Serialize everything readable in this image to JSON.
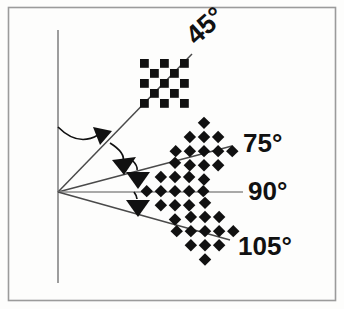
{
  "figure": {
    "background_color": "#fdfdfc",
    "border_color": "#9b9b9b",
    "ink_color": "#111111",
    "ray_color": "#4a4a4a",
    "axis_line_color": "#8c8c8c"
  },
  "vertical_axis": {
    "name": "vertical-reference-line",
    "x": 58,
    "y_top": 30,
    "y_bottom": 283,
    "color": "#8c8c8c"
  },
  "vertex": {
    "x": 58,
    "y": 192
  },
  "rays": [
    {
      "id": "ray-45",
      "angle_label": "45",
      "degree_symbol": "°",
      "label_text": "45°",
      "label_rotation_deg": -42,
      "label_x": 196,
      "label_y": 46,
      "tip_x": 192,
      "tip_y": 54
    },
    {
      "id": "ray-75",
      "angle_label": "75",
      "degree_symbol": "°",
      "label_text": "75°",
      "label_rotation_deg": 0,
      "label_x": 243,
      "label_y": 152,
      "tip_x": 232,
      "tip_y": 146
    },
    {
      "id": "ray-90",
      "angle_label": "90",
      "degree_symbol": "°",
      "label_text": "90°",
      "label_rotation_deg": 0,
      "label_x": 248,
      "label_y": 200,
      "tip_x": 243,
      "tip_y": 192
    },
    {
      "id": "ray-105",
      "angle_label": "105",
      "degree_symbol": "°",
      "label_text": "105°",
      "label_rotation_deg": 0,
      "label_x": 238,
      "label_y": 255,
      "tip_x": 230,
      "tip_y": 240
    }
  ],
  "arc_arrows": [
    {
      "id": "arc-vertical-to-45",
      "label": "rotation-from-vertical-to-45"
    },
    {
      "id": "arc-45-to-75",
      "label": "rotation-from-45-to-75"
    },
    {
      "id": "arc-75-to-90",
      "label": "rotation-from-75-to-90"
    },
    {
      "id": "arc-90-to-105",
      "label": "rotation-from-90-to-105"
    }
  ],
  "patterns": [
    {
      "id": "checkerboard-45",
      "for_angle": "45°",
      "center_x": 165,
      "center_y": 84,
      "cell": 10,
      "cols": 5,
      "rows": 5,
      "rotation_deg": 0,
      "squash_y": 1.0,
      "shape": "square"
    },
    {
      "id": "checkerboard-75",
      "for_angle": "75°",
      "center_x": 204,
      "center_y": 152,
      "cell": 10,
      "cols": 5,
      "rows": 5,
      "rotation_deg": 45,
      "squash_y": 1.0,
      "shape": "diamond"
    },
    {
      "id": "checkerboard-90",
      "for_angle": "90°",
      "center_x": 175,
      "center_y": 192,
      "cell": 10,
      "cols": 5,
      "rows": 5,
      "rotation_deg": 45,
      "squash_y": 1.0,
      "shape": "diamond"
    },
    {
      "id": "checkerboard-105",
      "for_angle": "105°",
      "center_x": 205,
      "center_y": 232,
      "cell": 10,
      "cols": 5,
      "rows": 5,
      "rotation_deg": 45,
      "squash_y": 1.0,
      "shape": "diamond"
    }
  ]
}
